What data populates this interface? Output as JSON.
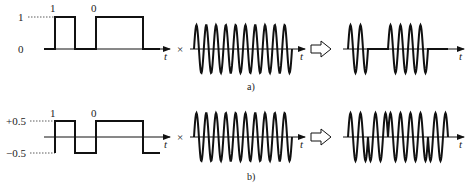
{
  "figure": {
    "panels": [
      {
        "id": "a",
        "caption": "a)",
        "baseband": {
          "levels": [
            {
              "label": "1",
              "value": 1
            },
            {
              "label": "0",
              "value": 0
            }
          ],
          "bits": [
            "1",
            "0"
          ],
          "axis_label": "t"
        },
        "operator": "×",
        "carrier": {
          "cycles": 10,
          "axis_label": "t"
        },
        "result": {
          "type": "OOK / ASK",
          "axis_label": "t"
        }
      },
      {
        "id": "b",
        "caption": "b)",
        "baseband": {
          "levels": [
            {
              "label": "+0.5",
              "value": 0.5
            },
            {
              "label": "−0.5",
              "value": -0.5
            }
          ],
          "bits": [
            "1",
            "0"
          ],
          "axis_label": "t"
        },
        "operator": "×",
        "carrier": {
          "cycles": 10,
          "axis_label": "t"
        },
        "result": {
          "type": "BPSK",
          "axis_label": "t"
        }
      }
    ],
    "arrow_symbol": "⇨",
    "colors": {
      "stroke": "#111111",
      "background": "#ffffff",
      "dotted": "#333333"
    }
  }
}
